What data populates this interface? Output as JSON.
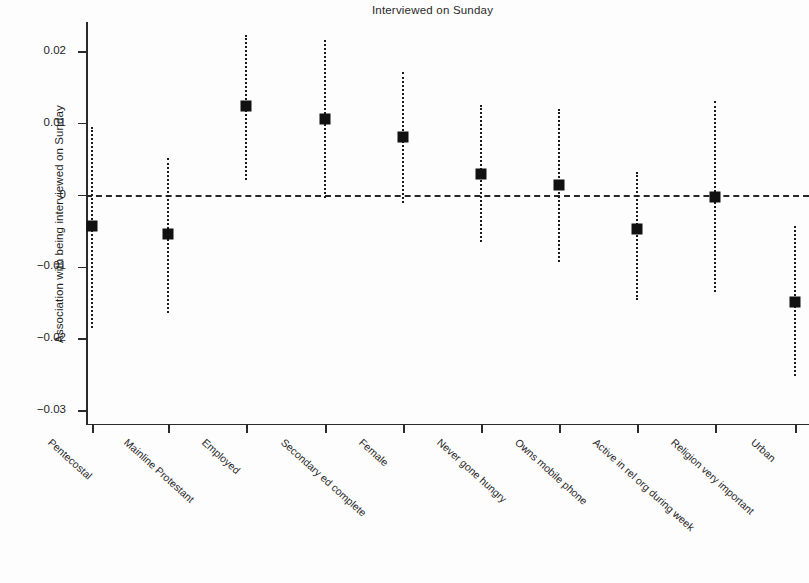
{
  "chart_data": {
    "type": "scatter",
    "title": "Interviewed on Sunday",
    "xlabel": "",
    "ylabel": "Association with being interviewed on Sunday",
    "ylim": [
      -0.032,
      0.024
    ],
    "yticks": [
      0.02,
      0.01,
      0,
      -0.01,
      -0.02,
      -0.03
    ],
    "ytick_labels": [
      "0.02",
      "0.01",
      "0",
      "-0.01",
      "-0.02",
      "-0.03"
    ],
    "grid": false,
    "legend": null,
    "reference_line": {
      "y": 0,
      "style": "dashed"
    },
    "categories": [
      "Pentecostal",
      "Mainline Protestant",
      "Employed",
      "Secondary ed complete",
      "Female",
      "Never gone hungry",
      "Owns mobile phone",
      "Active in rel org during week",
      "Religion very important",
      "Urban"
    ],
    "values": [
      -0.0042,
      -0.0053,
      0.0124,
      0.0107,
      0.0081,
      0.003,
      0.0014,
      -0.0046,
      -0.0002,
      -0.0149
    ],
    "ci_lower": [
      -0.0185,
      -0.0163,
      0.0022,
      -0.0003,
      -0.001,
      -0.0065,
      -0.0093,
      -0.0146,
      -0.0134,
      -0.0252
    ],
    "ci_upper": [
      0.0095,
      0.0052,
      0.0223,
      0.0216,
      0.0172,
      0.0126,
      0.012,
      0.0033,
      0.0131,
      -0.0043
    ],
    "series": [
      {
        "name": "Association with being interviewed on Sunday",
        "points": [
          {
            "category": "Pentecostal",
            "value": -0.0042,
            "ci_lower": -0.0185,
            "ci_upper": 0.0095
          },
          {
            "category": "Mainline Protestant",
            "value": -0.0053,
            "ci_lower": -0.0163,
            "ci_upper": 0.0052
          },
          {
            "category": "Employed",
            "value": 0.0124,
            "ci_lower": 0.0022,
            "ci_upper": 0.0223
          },
          {
            "category": "Secondary ed complete",
            "value": 0.0107,
            "ci_lower": -0.0003,
            "ci_upper": 0.0216
          },
          {
            "category": "Female",
            "value": 0.0081,
            "ci_lower": -0.001,
            "ci_upper": 0.0172
          },
          {
            "category": "Never gone hungry",
            "value": 0.003,
            "ci_lower": -0.0065,
            "ci_upper": 0.0126
          },
          {
            "category": "Owns mobile phone",
            "value": 0.0014,
            "ci_lower": -0.0093,
            "ci_upper": 0.012
          },
          {
            "category": "Active in rel org during week",
            "value": -0.0046,
            "ci_lower": -0.0146,
            "ci_upper": 0.0033
          },
          {
            "category": "Religion very important",
            "value": -0.0002,
            "ci_lower": -0.0134,
            "ci_upper": 0.0131
          },
          {
            "category": "Urban",
            "value": -0.0149,
            "ci_lower": -0.0252,
            "ci_upper": -0.0043
          }
        ]
      }
    ],
    "marker_color": "#111111",
    "line_color": "#1a1a1a"
  }
}
